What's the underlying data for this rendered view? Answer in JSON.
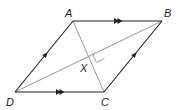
{
  "figure": {
    "type": "parallelogram",
    "stroke_color": "#231f20",
    "diagonal_color": "#6d6e71",
    "vertices": {
      "A": {
        "label": "A",
        "x": 73,
        "y": 21
      },
      "B": {
        "label": "B",
        "x": 162,
        "y": 21
      },
      "C": {
        "label": "C",
        "x": 104,
        "y": 92
      },
      "D": {
        "label": "D",
        "x": 15,
        "y": 92
      }
    },
    "intersection": {
      "label": "X"
    },
    "marks": {
      "double_arrow_sides": [
        "AB",
        "DC"
      ],
      "single_arrow_sides": [
        "DA",
        "CB"
      ],
      "right_angle_at": "X"
    }
  }
}
